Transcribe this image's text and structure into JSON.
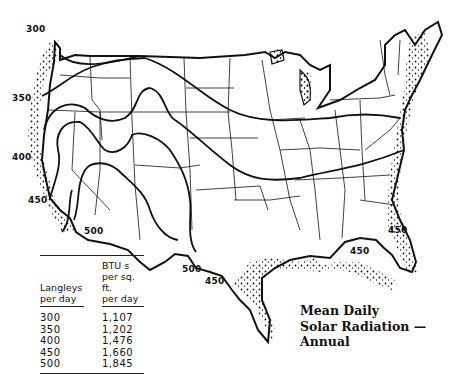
{
  "title": {
    "line1": "Mean Daily",
    "line2": "Solar Radiation —",
    "line3": "Annual"
  },
  "isolines": [
    {
      "label": "300",
      "x": 26,
      "y": 24
    },
    {
      "label": "350",
      "x": 12,
      "y": 93
    },
    {
      "label": "400",
      "x": 12,
      "y": 152
    },
    {
      "label": "450",
      "x": 28,
      "y": 195
    },
    {
      "label": "500",
      "x": 84,
      "y": 226
    },
    {
      "label": "500",
      "x": 182,
      "y": 264
    },
    {
      "label": "450",
      "x": 205,
      "y": 276
    },
    {
      "label": "450",
      "x": 388,
      "y": 225
    },
    {
      "label": "450",
      "x": 350,
      "y": 246
    }
  ],
  "legend": {
    "col1_header": [
      "Langleys",
      "per day"
    ],
    "col2_header": [
      "BTU s",
      "per sq. ft.",
      "per day"
    ],
    "rows": [
      {
        "langleys": "300",
        "btu": "1,107"
      },
      {
        "langleys": "350",
        "btu": "1,202"
      },
      {
        "langleys": "400",
        "btu": "1,476"
      },
      {
        "langleys": "450",
        "btu": "1,660"
      },
      {
        "langleys": "500",
        "btu": "1,845"
      }
    ]
  },
  "colors": {
    "ink": "#111111",
    "background": "#ffffff"
  }
}
